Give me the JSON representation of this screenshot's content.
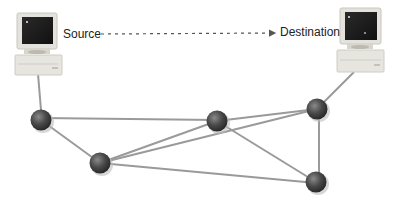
{
  "diagram": {
    "type": "network-routing",
    "labels": {
      "source": "Source",
      "destination": "Destination"
    },
    "colors": {
      "edge": "#9a9a9a",
      "node": "#4a4a4a",
      "node_highlight": "#8a8a8a",
      "computer_body": "#e4e2dc",
      "computer_screen": "#1e1e1e",
      "arrow": "#555555"
    },
    "hosts": [
      {
        "id": "source-pc",
        "role": "Source"
      },
      {
        "id": "destination-pc",
        "role": "Destination"
      }
    ],
    "routers": [
      {
        "id": "A",
        "x": 41,
        "y": 120
      },
      {
        "id": "B",
        "x": 100,
        "y": 163
      },
      {
        "id": "C",
        "x": 217,
        "y": 121
      },
      {
        "id": "D",
        "x": 317,
        "y": 109
      },
      {
        "id": "E",
        "x": 316,
        "y": 182
      }
    ],
    "links": [
      [
        "source-pc",
        "A"
      ],
      [
        "A",
        "C"
      ],
      [
        "A",
        "B"
      ],
      [
        "B",
        "C"
      ],
      [
        "B",
        "D"
      ],
      [
        "B",
        "E"
      ],
      [
        "C",
        "D"
      ],
      [
        "C",
        "E"
      ],
      [
        "D",
        "E"
      ],
      [
        "D",
        "destination-pc"
      ]
    ]
  }
}
